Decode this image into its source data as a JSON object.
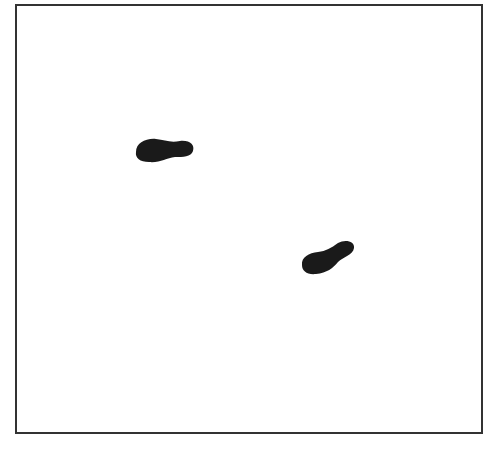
{
  "figure": {
    "frame": {
      "left": 15,
      "top": 4,
      "right": 481,
      "bottom": 432,
      "border_color": "#333333"
    },
    "blobs": [
      {
        "label": "spot-1",
        "color": "#1a1a1a",
        "bbox": [
          135,
          138,
          194,
          163
        ]
      },
      {
        "label": "spot-2",
        "color": "#1a1a1a",
        "bbox": [
          301,
          240,
          355,
          275
        ]
      }
    ]
  }
}
